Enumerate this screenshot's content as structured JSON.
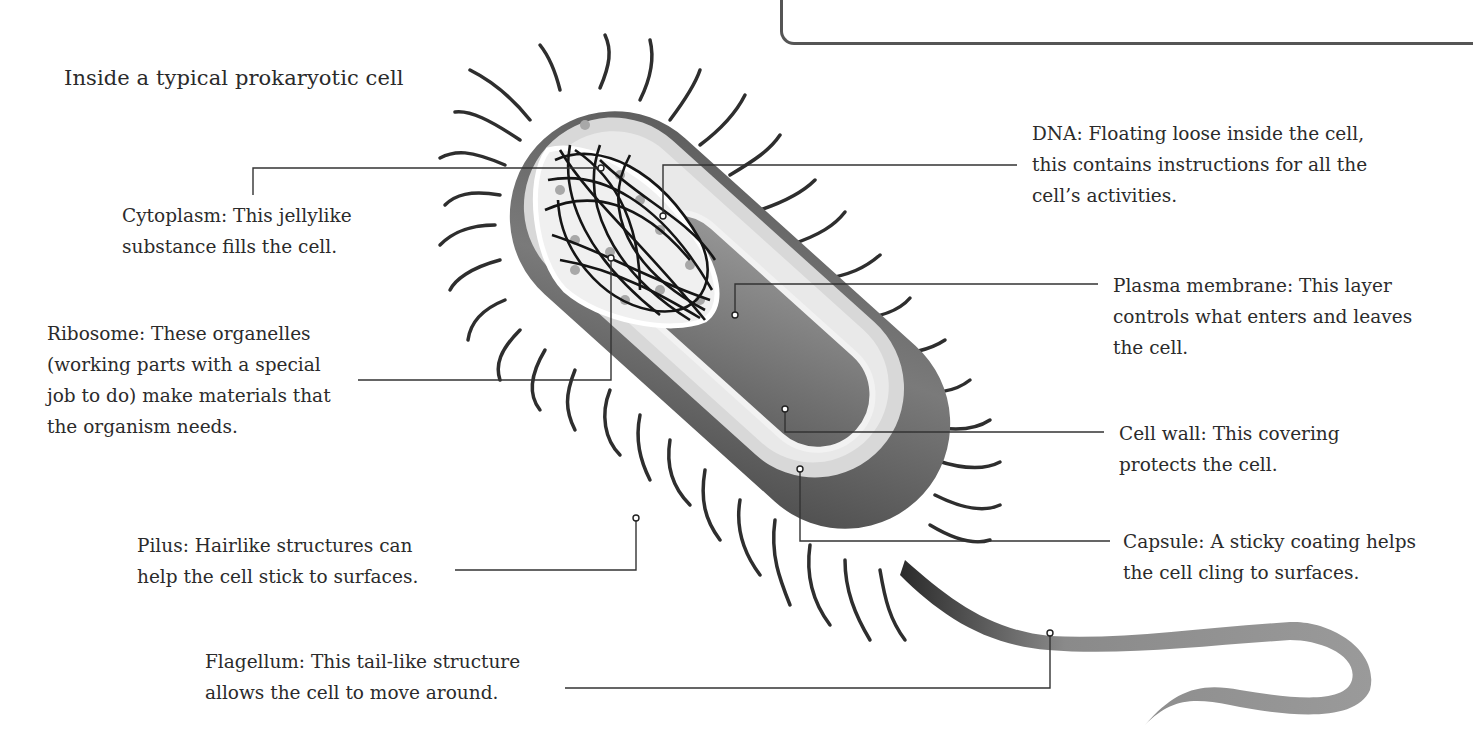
{
  "diagram": {
    "title": "Inside a typical prokaryotic cell",
    "colors": {
      "background": "#ffffff",
      "text": "#2b2b2b",
      "leader_line": "#333333",
      "capsule": "#6e6e6e",
      "cell_wall": "#d9d9d9",
      "cytoplasm": "#e6e6e6",
      "dna": "#1a1a1a",
      "flagellum": "#8a8a8a"
    },
    "labels": [
      {
        "id": "cytoplasm",
        "lines": [
          "Cytoplasm: This jellylike",
          "substance fills the cell."
        ]
      },
      {
        "id": "dna",
        "lines": [
          "DNA: Floating loose inside the cell,",
          "this contains instructions for all the",
          "cell’s activities."
        ]
      },
      {
        "id": "ribosome",
        "lines": [
          "Ribosome: These organelles",
          "(working parts with a special",
          "job to do) make materials that",
          "the organism needs."
        ]
      },
      {
        "id": "plasma_membrane",
        "lines": [
          "Plasma membrane: This layer",
          "controls what enters and leaves",
          "the cell."
        ]
      },
      {
        "id": "cell_wall",
        "lines": [
          "Cell wall: This covering",
          "protects the cell."
        ]
      },
      {
        "id": "pilus",
        "lines": [
          "Pilus: Hairlike structures can",
          "help the cell stick to surfaces."
        ]
      },
      {
        "id": "capsule",
        "lines": [
          "Capsule: A sticky coating helps",
          "the cell cling to surfaces."
        ]
      },
      {
        "id": "flagellum",
        "lines": [
          "Flagellum: This tail-like structure",
          "allows the cell to move around."
        ]
      }
    ]
  }
}
